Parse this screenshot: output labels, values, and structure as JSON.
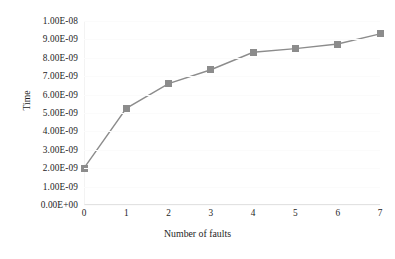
{
  "chart_data": {
    "type": "line",
    "title": "",
    "xlabel": "Number of faults",
    "ylabel": "Time",
    "x": [
      0,
      1,
      2,
      3,
      4,
      5,
      6,
      7
    ],
    "xticklabels": [
      "0",
      "1",
      "2",
      "3",
      "4",
      "5",
      "6",
      "7"
    ],
    "values": [
      2e-09,
      5.25e-09,
      6.6e-09,
      7.35e-09,
      8.3e-09,
      8.5e-09,
      8.75e-09,
      9.3e-09
    ],
    "series": [
      {
        "name": "Time",
        "values": [
          2e-09,
          5.25e-09,
          6.6e-09,
          7.35e-09,
          8.3e-09,
          8.5e-09,
          8.75e-09,
          9.3e-09
        ]
      }
    ],
    "yticklabels": [
      "0.00E+00",
      "1.00E-09",
      "2.00E-09",
      "3.00E-09",
      "4.00E-09",
      "5.00E-09",
      "6.00E-09",
      "7.00E-09",
      "8.00E-09",
      "9.00E-09",
      "1.00E-08"
    ],
    "ytickvalues": [
      0,
      1e-09,
      2e-09,
      3e-09,
      4e-09,
      5e-09,
      6e-09,
      7e-09,
      8e-09,
      9e-09,
      1e-08
    ],
    "ylim": [
      0,
      1e-08
    ],
    "xlim": [
      0,
      7
    ],
    "grid": false,
    "legend": false,
    "marker": "square",
    "line_color": "#8c8c8c",
    "marker_color": "#8c8c8c",
    "text_color": "#1d1d1d",
    "background": "#ffffff"
  }
}
